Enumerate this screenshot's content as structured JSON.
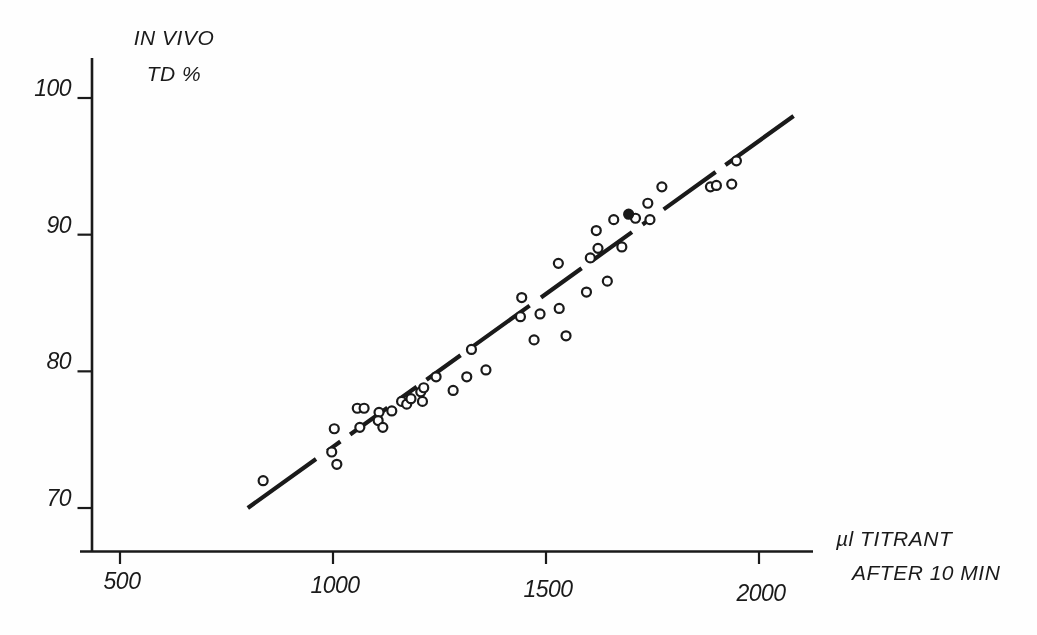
{
  "figure": {
    "background": "#fefefe",
    "ink_color": "#1a1a1a",
    "style": "scanned-paper-figure"
  },
  "chart_data": {
    "type": "scatter",
    "title": "",
    "y_axis": {
      "label_lines": [
        "IN VIVO",
        "TD %"
      ],
      "ticks": [
        100,
        90,
        80,
        70
      ],
      "range": [
        67,
        102.5
      ],
      "grid": false
    },
    "x_axis": {
      "label_lines": [
        "µl TITRANT",
        "AFTER 10 MIN"
      ],
      "ticks": [
        500,
        1000,
        1500,
        2000
      ],
      "range": [
        405,
        2125
      ],
      "grid": false
    },
    "legend": null,
    "marker": "open-circle",
    "points": [
      [
        836,
        72.0
      ],
      [
        997,
        74.1
      ],
      [
        1003,
        75.8
      ],
      [
        1009,
        73.2
      ],
      [
        1057,
        77.3
      ],
      [
        1073,
        77.3
      ],
      [
        1063,
        75.9
      ],
      [
        1108,
        77.0
      ],
      [
        1106,
        76.4
      ],
      [
        1117,
        75.9
      ],
      [
        1138,
        77.1
      ],
      [
        1161,
        77.8
      ],
      [
        1173,
        77.6
      ],
      [
        1183,
        78.0
      ],
      [
        1206,
        78.5
      ],
      [
        1213,
        78.8
      ],
      [
        1210,
        77.8
      ],
      [
        1242,
        79.6
      ],
      [
        1282,
        78.6
      ],
      [
        1314,
        79.6
      ],
      [
        1325,
        81.6
      ],
      [
        1359,
        80.1
      ],
      [
        1440,
        84.0
      ],
      [
        1443,
        85.4
      ],
      [
        1472,
        82.3
      ],
      [
        1486,
        84.2
      ],
      [
        1531,
        84.6
      ],
      [
        1547,
        82.6
      ],
      [
        1529,
        87.9
      ],
      [
        1595,
        85.8
      ],
      [
        1604,
        88.3
      ],
      [
        1618,
        90.3
      ],
      [
        1622,
        89.0
      ],
      [
        1644,
        86.6
      ],
      [
        1659,
        91.1
      ],
      [
        1678,
        89.1
      ],
      [
        1710,
        91.2
      ],
      [
        1739,
        92.3
      ],
      [
        1744,
        91.1
      ],
      [
        1772,
        93.5
      ],
      [
        1886,
        93.5
      ],
      [
        1900,
        93.6
      ],
      [
        1936,
        93.7
      ],
      [
        1947,
        95.4
      ]
    ],
    "filled_points": [
      [
        1694,
        91.5
      ]
    ],
    "trend_line": {
      "x1": 800,
      "y1": 70.0,
      "x2": 2082,
      "y2": 98.7,
      "style": "dashed"
    }
  }
}
